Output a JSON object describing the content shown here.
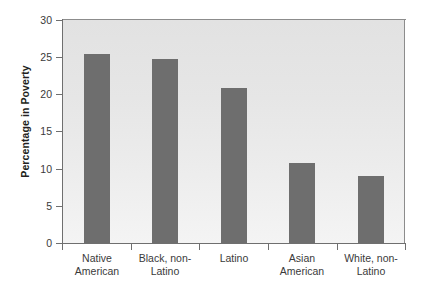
{
  "chart_data": {
    "type": "bar",
    "title": "",
    "xlabel": "",
    "ylabel": "Percentage in Poverty",
    "ylim": [
      0,
      30
    ],
    "ytick_step": 5,
    "yticks": [
      "30",
      "25",
      "20",
      "15",
      "10",
      "5",
      "0"
    ],
    "grid": false,
    "legend": null,
    "categories": [
      "Native American",
      "Black, non-Latino",
      "Latino",
      "Asian American",
      "White, non-Latino"
    ],
    "category_lines": [
      [
        "Native",
        "American"
      ],
      [
        "Black, non-",
        "Latino"
      ],
      [
        "Latino",
        ""
      ],
      [
        "Asian",
        "American"
      ],
      [
        "White, non-",
        "Latino"
      ]
    ],
    "values": [
      25.4,
      24.7,
      20.8,
      10.7,
      9.0
    ],
    "bar_color": "#6e6e6e",
    "plot_background": "#e8e8e8",
    "axis_color": "#6f6f6f",
    "text_color": "#3a3a3a"
  }
}
